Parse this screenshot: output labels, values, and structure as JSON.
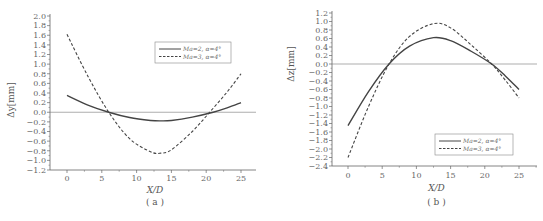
{
  "chart_data": [
    {
      "type": "line",
      "panel_label": "( a )",
      "title": "",
      "xlabel": "X/D",
      "ylabel": "Δy[mm]",
      "xlim": [
        -2,
        27
      ],
      "ylim": [
        -1.2,
        2.0
      ],
      "x_ticks": [
        0,
        5,
        10,
        15,
        20,
        25
      ],
      "y_ticks": [
        2.0,
        1.8,
        1.6,
        1.4,
        1.2,
        1.0,
        0.8,
        0.6,
        0.4,
        0.2,
        0.0,
        -0.2,
        -0.4,
        -0.6,
        -0.8,
        -1.0,
        -1.2
      ],
      "y_tick_labels": [
        "2.0",
        "1.8",
        "1.6",
        "1.4",
        "1.2",
        "1.0",
        "0.8",
        "0.6",
        "0.4",
        "0.2",
        "0.0",
        "−0.2",
        "−0.4",
        "−0.6",
        "−0.8",
        "−1.0",
        "−1.2"
      ],
      "grid": false,
      "zero_line": true,
      "legend_position": "upper right",
      "series": [
        {
          "name": "Ma=2, α=4°",
          "style": "solid",
          "x": [
            0,
            3,
            6,
            9,
            12,
            13.5,
            15,
            18,
            21,
            23,
            25
          ],
          "values": [
            0.35,
            0.15,
            0.0,
            -0.11,
            -0.17,
            -0.18,
            -0.17,
            -0.1,
            0.0,
            0.09,
            0.2
          ]
        },
        {
          "name": "Ma=3, α=4°",
          "style": "dashed",
          "x": [
            0,
            3,
            6,
            9,
            12,
            13.5,
            15,
            18,
            20.5,
            23,
            25
          ],
          "values": [
            1.62,
            0.75,
            0.0,
            -0.55,
            -0.82,
            -0.85,
            -0.78,
            -0.4,
            0.0,
            0.42,
            0.8
          ]
        }
      ]
    },
    {
      "type": "line",
      "panel_label": "( b )",
      "title": "",
      "xlabel": "X/D",
      "ylabel": "Δz[mm]",
      "xlim": [
        -2,
        27
      ],
      "ylim": [
        -2.4,
        1.2
      ],
      "x_ticks": [
        0,
        5,
        10,
        15,
        20,
        25
      ],
      "y_ticks": [
        1.2,
        1.0,
        0.8,
        0.6,
        0.4,
        0.2,
        0.0,
        -0.2,
        -0.4,
        -0.6,
        -0.8,
        -1.0,
        -1.2,
        -1.4,
        -1.6,
        -1.8,
        -2.0,
        -2.2,
        -2.4
      ],
      "y_tick_labels": [
        "1.2",
        "1.0",
        "0.8",
        "0.6",
        "0.4",
        "0.2",
        "0.0",
        "−0.2",
        "−0.4",
        "−0.6",
        "−0.8",
        "−1.0",
        "−1.2",
        "−1.4",
        "−1.6",
        "−1.8",
        "−2.0",
        "−2.2",
        "−2.4"
      ],
      "grid": false,
      "zero_line": true,
      "legend_position": "lower right",
      "series": [
        {
          "name": "Ma=2, α=4°",
          "style": "solid",
          "x": [
            0,
            3,
            6,
            9,
            12.5,
            15,
            18,
            21,
            23,
            25
          ],
          "values": [
            -1.45,
            -0.65,
            0.0,
            0.42,
            0.62,
            0.55,
            0.3,
            0.0,
            -0.28,
            -0.6
          ]
        },
        {
          "name": "Ma=3, α=4°",
          "style": "dashed",
          "x": [
            0,
            3,
            6,
            9,
            12.5,
            15,
            18,
            21,
            23,
            25
          ],
          "values": [
            -2.2,
            -1.0,
            0.0,
            0.65,
            0.95,
            0.85,
            0.45,
            0.0,
            -0.38,
            -0.8
          ]
        }
      ]
    }
  ],
  "panels": {
    "a": {
      "ylabel": "Δy[mm]",
      "xlabel": "X/D",
      "sub_label": "( a )",
      "legend": [
        "Ma=2, α=4°",
        "Ma=3, α=4°"
      ]
    },
    "b": {
      "ylabel": "Δz[mm]",
      "xlabel": "X/D",
      "sub_label": "( b )",
      "legend": [
        "Ma=2, α=4°",
        "Ma=3, α=4°"
      ]
    }
  },
  "colors": {
    "line": "#444444",
    "axis": "#666666",
    "text": "#555555"
  }
}
